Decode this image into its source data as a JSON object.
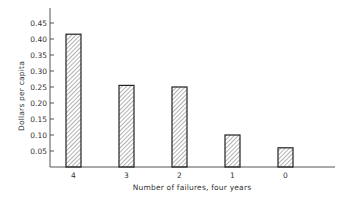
{
  "chart_data": {
    "type": "bar",
    "title": "",
    "xlabel": "Number of failures, four years",
    "ylabel": "Dollars per capita",
    "categories": [
      "4",
      "3",
      "2",
      "1",
      "0"
    ],
    "values": [
      0.415,
      0.255,
      0.25,
      0.1,
      0.06
    ],
    "ylim": [
      0,
      0.5
    ],
    "yticks": [
      "0.05",
      "0.10",
      "0.15",
      "0.20",
      "0.25",
      "0.30",
      "0.35",
      "0.40",
      "0.45"
    ],
    "grid": false,
    "legend": null,
    "bar_style": "hatched"
  },
  "colors": {
    "axis": "#555555",
    "bar_outline": "#222222",
    "hatch": "#666666",
    "background": "#ffffff"
  }
}
